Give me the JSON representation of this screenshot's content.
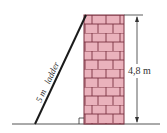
{
  "diagram": {
    "type": "ladder-against-wall",
    "ladder_label": "5 m   ladder",
    "ladder_length_label": "5 m",
    "ladder_word": "ladder",
    "wall_height_label": "4,8 m",
    "colors": {
      "brick_fill": "#eab2bc",
      "mortar": "#7a3040",
      "line": "#222222",
      "background": "#ffffff"
    }
  }
}
